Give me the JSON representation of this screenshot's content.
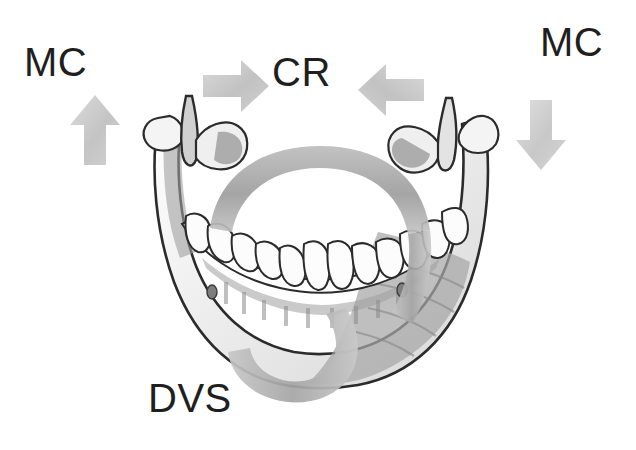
{
  "figure": {
    "kind": "anatomical-diagram",
    "background_color": "#ffffff"
  },
  "labels": {
    "mc_left": "MC",
    "cr": "CR",
    "mc_right": "MC",
    "dvs": "DVS"
  },
  "arrows": [
    {
      "name": "arrow-up-left",
      "direction": "up",
      "fill_color": "#c9c9c9",
      "associated_label": "MC",
      "x": 70,
      "y": 95,
      "width": 50,
      "height": 70
    },
    {
      "name": "arrow-right",
      "direction": "right",
      "fill_color": "#c9c9c9",
      "associated_label": "CR",
      "x": 203,
      "y": 60,
      "width": 66,
      "height": 52
    },
    {
      "name": "arrow-left",
      "direction": "left",
      "fill_color": "#c9c9c9",
      "associated_label": "CR",
      "x": 358,
      "y": 64,
      "width": 66,
      "height": 52
    },
    {
      "name": "arrow-down-right",
      "direction": "down",
      "fill_color": "#c9c9c9",
      "associated_label": "MC",
      "x": 516,
      "y": 100,
      "width": 50,
      "height": 70
    }
  ],
  "ribbons": [
    {
      "name": "rotation-ribbon-upper",
      "description": "gray band arcing over the anterior teeth",
      "fill_color": "#a9a9a9"
    },
    {
      "name": "rotation-ribbon-lower",
      "description": "gray band looping below the mandibular body toward DVS",
      "fill_color": "#b0b0b0"
    }
  ],
  "illustration": {
    "outline_color": "#2b2b2b",
    "shade_color": "#9a9a9a",
    "tooth_fill": "#fbfbfb",
    "bone_fill": "#ffffff",
    "parts": [
      "left-condyle",
      "left-coronoid-process",
      "left-ramus",
      "right-condyle",
      "right-coronoid-process",
      "right-ramus",
      "mandibular-body",
      "dental-arch-teeth",
      "mental-foramen-left",
      "mental-foramen-right"
    ]
  }
}
